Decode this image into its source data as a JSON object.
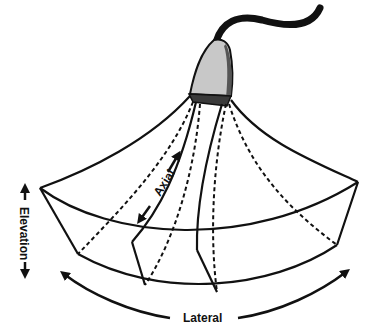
{
  "diagram": {
    "type": "ultrasound-probe-beam-geometry",
    "labels": {
      "axial": "Axial",
      "elevation": "Elevation",
      "lateral": "Lateral"
    },
    "colors": {
      "line": "#111111",
      "probe_body": "#c8c8c8",
      "probe_face": "#3a3a3a",
      "cable": "#111111",
      "background": "#ffffff"
    }
  }
}
